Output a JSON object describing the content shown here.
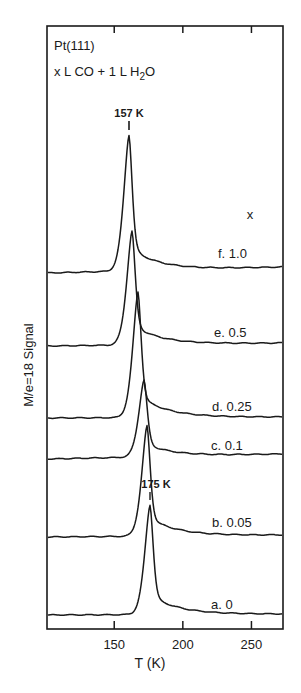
{
  "chart_data": {
    "type": "line",
    "title": "Pt(111)",
    "subtitle_parts": {
      "pre": "x L CO + 1 L H",
      "sub": "2",
      "post": "O"
    },
    "xlabel": "T (K)",
    "ylabel": "M/e=18 Signal",
    "xlim": [
      101,
      273
    ],
    "x_ticks": [
      150,
      200,
      250
    ],
    "x_tick_labels": [
      "150",
      "200",
      "250"
    ],
    "y_ticks_shown": false,
    "grid": false,
    "legend_header": "x",
    "annotations": [
      {
        "text": "157 K",
        "x": 157,
        "series": "f"
      },
      {
        "text": "175 K",
        "x": 175,
        "series": "a"
      }
    ],
    "series": [
      {
        "id": "f",
        "name": "f. 1.0",
        "x_exposure": 1.0,
        "peak_T": 157,
        "offset": 5,
        "peak_height": 1.0
      },
      {
        "id": "e",
        "name": "e. 0.5",
        "x_exposure": 0.5,
        "peak_T": 160,
        "offset": 4,
        "peak_height": 0.88
      },
      {
        "id": "d",
        "name": "d. 0.25",
        "x_exposure": 0.25,
        "peak_T": 165,
        "offset": 3,
        "peak_height": 0.94
      },
      {
        "id": "c",
        "name": "c. 0.1",
        "x_exposure": 0.1,
        "peak_T": 169,
        "offset": 2,
        "peak_height": 0.58
      },
      {
        "id": "b",
        "name": "b. 0.05",
        "x_exposure": 0.05,
        "peak_T": 172,
        "offset": 1,
        "peak_height": 0.83
      },
      {
        "id": "a",
        "name": "a. 0",
        "x_exposure": 0,
        "peak_T": 175,
        "offset": 0,
        "peak_height": 0.82
      }
    ]
  },
  "render": {
    "frame": {
      "x0": 47,
      "y0": 26,
      "x1": 283,
      "y1": 629
    },
    "traces": [
      {
        "id": "f",
        "base_left": 273,
        "base_right": 267,
        "peak_x": 129,
        "peak_y": 135,
        "label_x": 218,
        "label_y": 258
      },
      {
        "id": "e",
        "base_left": 346,
        "base_right": 343,
        "peak_x": 132,
        "peak_y": 231,
        "label_x": 214,
        "label_y": 337
      },
      {
        "id": "d",
        "base_left": 418,
        "base_right": 417,
        "peak_x": 138,
        "peak_y": 292,
        "label_x": 212,
        "label_y": 411
      },
      {
        "id": "c",
        "base_left": 459,
        "base_right": 454,
        "peak_x": 144,
        "peak_y": 380,
        "label_x": 211,
        "label_y": 450
      },
      {
        "id": "b",
        "base_left": 537,
        "base_right": 535,
        "peak_x": 147,
        "peak_y": 426,
        "label_x": 212,
        "label_y": 527
      },
      {
        "id": "a",
        "base_left": 615,
        "base_right": 614,
        "peak_x": 150,
        "peak_y": 505,
        "label_x": 211,
        "label_y": 609
      }
    ]
  }
}
